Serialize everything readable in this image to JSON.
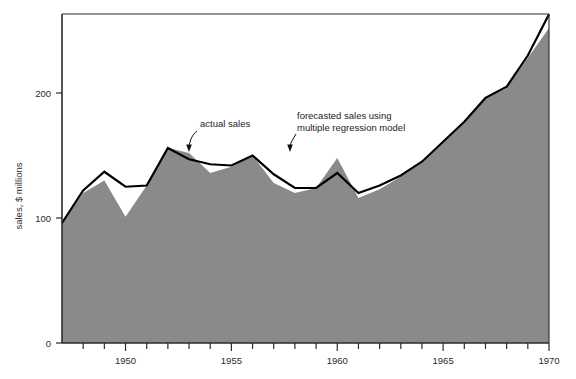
{
  "chart_data": {
    "type": "area",
    "title": "",
    "xlabel": "",
    "ylabel": "sales, $ millions",
    "xlim": [
      1947,
      1970
    ],
    "ylim": [
      0,
      265
    ],
    "yticks": [
      0,
      100,
      200
    ],
    "ytick_labels": [
      "0",
      "100",
      "200"
    ],
    "xticks": [
      1948,
      1949,
      1950,
      1951,
      1952,
      1953,
      1954,
      1955,
      1956,
      1957,
      1958,
      1959,
      1960,
      1961,
      1962,
      1963,
      1964,
      1965,
      1966,
      1967,
      1968,
      1969,
      1970
    ],
    "xtick_labels_shown": [
      "1950",
      "1955",
      "1960",
      "1965",
      "1970"
    ],
    "xtick_labels_values": [
      1950,
      1955,
      1960,
      1965,
      1970
    ],
    "grid": false,
    "legend": "annotations",
    "x": [
      1947,
      1948,
      1949,
      1950,
      1951,
      1952,
      1953,
      1954,
      1955,
      1956,
      1957,
      1958,
      1959,
      1960,
      1961,
      1962,
      1963,
      1964,
      1965,
      1966,
      1967,
      1968,
      1969,
      1970
    ],
    "series": [
      {
        "name": "actual sales",
        "kind": "line",
        "color": "#000000",
        "values": [
          96,
          122,
          137,
          125,
          126,
          156,
          147,
          143,
          142,
          150,
          135,
          124,
          124,
          136,
          120,
          126,
          134,
          145,
          161,
          177,
          196,
          205,
          230,
          263
        ]
      },
      {
        "name": "forecasted sales using multiple regression model",
        "kind": "area",
        "color": "#8a8a8a",
        "values": [
          96,
          120,
          130,
          101,
          126,
          156,
          152,
          136,
          141,
          150,
          128,
          120,
          124,
          148,
          116,
          123,
          133,
          144,
          160,
          176,
          195,
          204,
          228,
          252
        ]
      }
    ],
    "annotations": [
      {
        "id": "actual-sales",
        "text": "actual sales",
        "text_x": 200,
        "text_y": 124,
        "point_x": 189,
        "point_y": 150
      },
      {
        "id": "forecasted-sales",
        "text_line1": "forecasted sales using",
        "text_line2": "multiple regression model",
        "text_x": 297,
        "text_y": 122,
        "point_x": 290,
        "point_y": 149
      }
    ],
    "colors": {
      "area_fill": "#8a8a8a",
      "line": "#000000",
      "axis": "#2b2b2b",
      "text": "#2a2a2a",
      "background": "#ffffff"
    }
  },
  "caption": {
    "text": ""
  }
}
